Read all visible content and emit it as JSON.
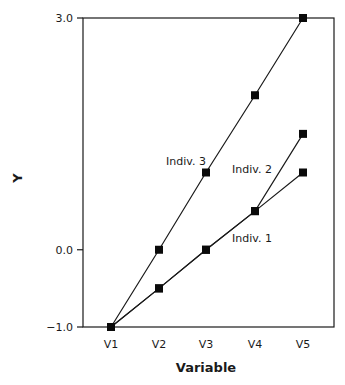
{
  "chart_data": {
    "type": "line",
    "title": "",
    "xlabel": "Variable",
    "ylabel": "Y",
    "categories": [
      "V1",
      "V2",
      "V3",
      "V4",
      "V5"
    ],
    "ylim": [
      -1.0,
      3.0
    ],
    "yticks": [
      {
        "value": 3.0,
        "label": "3.0"
      },
      {
        "value": 0.0,
        "label": "0.0"
      },
      {
        "value": -1.0,
        "label": "-1.0"
      }
    ],
    "grid": false,
    "legend": "none (inline labels)",
    "series": [
      {
        "name": "Indiv. 1",
        "values": [
          -1.0,
          -0.5,
          0.0,
          0.5,
          1.0
        ]
      },
      {
        "name": "Indiv. 2",
        "values": [
          -1.0,
          -0.5,
          0.0,
          0.5,
          1.5
        ]
      },
      {
        "name": "Indiv. 3",
        "values": [
          -1.0,
          0.0,
          1.0,
          2.0,
          3.0
        ]
      }
    ],
    "marker": "filled-square",
    "line_color": "#1a1a1a"
  }
}
